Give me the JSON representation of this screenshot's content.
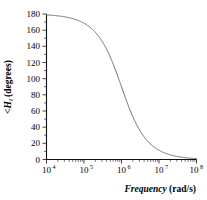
{
  "chart_data": {
    "type": "line",
    "title": "",
    "subtitle": "",
    "xlabel": "Frequency (rad/s)",
    "xlabel_italic_part": "Frequency",
    "xlabel_plain_part": " (rad/s)",
    "ylabel": "<H_l (degrees)",
    "ylabel_prefix": "<H",
    "ylabel_subscript": "l",
    "ylabel_suffix": " (degrees)",
    "xscale": "log",
    "yscale": "linear",
    "xlim": [
      10000,
      100000000
    ],
    "ylim": [
      0,
      180
    ],
    "grid": false,
    "legend": null,
    "xtick_labels": [
      "10",
      "10",
      "10",
      "10",
      "10"
    ],
    "xtick_exponents": [
      "4",
      "5",
      "6",
      "7",
      "8"
    ],
    "xtick_values": [
      10000,
      100000,
      1000000,
      10000000,
      100000000
    ],
    "ytick_labels": [
      "0",
      "20",
      "40",
      "60",
      "80",
      "100",
      "120",
      "140",
      "160",
      "180"
    ],
    "ytick_values": [
      0,
      20,
      40,
      60,
      80,
      100,
      120,
      140,
      160,
      180
    ],
    "series": [
      {
        "name": "phase",
        "color": "#6b6b6b",
        "corner_frequency": 1000000,
        "x": [
          10000,
          12589,
          15849,
          19953,
          25119,
          31623,
          39811,
          50119,
          63096,
          79433,
          100000,
          125893,
          158489,
          199526,
          251189,
          316228,
          398107,
          501187,
          630957,
          794328,
          1000000,
          1258925,
          1584893,
          1995262,
          2511886,
          3162278,
          3981072,
          5011872,
          6309573,
          7943282,
          10000000,
          12589254,
          15848932,
          19952623,
          25118864,
          31622777,
          39810717,
          50118723,
          63095734,
          79432823,
          100000000
        ],
        "y": [
          178.9,
          178.6,
          178.2,
          177.7,
          177.1,
          176.4,
          175.4,
          174.3,
          172.8,
          171.0,
          168.6,
          165.7,
          161.9,
          157.2,
          151.4,
          144.2,
          135.7,
          125.8,
          114.8,
          102.9,
          90.0,
          77.1,
          65.2,
          54.2,
          44.3,
          35.8,
          28.6,
          22.8,
          18.1,
          14.3,
          11.4,
          9.1,
          7.2,
          5.7,
          4.6,
          3.6,
          2.9,
          2.3,
          1.8,
          1.4,
          1.1
        ]
      }
    ],
    "annotations": []
  },
  "figure": {
    "background_color": "#ffffff",
    "axis_color": "#111111",
    "curve_color": "#6b6b6b"
  }
}
